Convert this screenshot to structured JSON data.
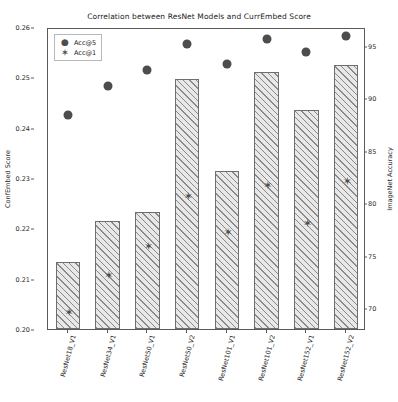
{
  "chart_data": {
    "type": "bar",
    "title": "Correlation between ResNet Models and CurrEmbed Score",
    "categories": [
      "ResNet18_V1",
      "ResNet34_V1",
      "ResNet50_V1",
      "ResNet50_V2",
      "ResNet101_V1",
      "ResNet101_V2",
      "ResNet152_V1",
      "ResNet152_V2"
    ],
    "xlabel": "",
    "ylabel": "ConfEmbed Score",
    "ylim": [
      0.2,
      0.26
    ],
    "yticks": [
      "0.20",
      "0.21",
      "0.22",
      "0.23",
      "0.24",
      "0.25",
      "0.26"
    ],
    "ytickvalues": [
      0.2,
      0.21,
      0.22,
      0.23,
      0.24,
      0.25,
      0.26
    ],
    "y2label": "ImageNet Accuracy",
    "y2lim": [
      68.0,
      96.8
    ],
    "y2ticks": [
      "70",
      "75",
      "80",
      "85",
      "90",
      "95"
    ],
    "y2tickvalues": [
      70,
      75,
      80,
      85,
      90,
      95
    ],
    "grid": false,
    "legend_position": "upper left",
    "series": [
      {
        "name": "bars",
        "label": "ConfEmbed Score",
        "axis": "left",
        "values": [
          0.2134,
          0.2215,
          0.2233,
          0.2497,
          0.2314,
          0.2511,
          0.2435,
          0.2525
        ]
      },
      {
        "name": "Acc@5",
        "label": "Acc@5",
        "axis": "right",
        "marker": "circle",
        "values": [
          88.6,
          91.4,
          92.9,
          95.4,
          93.5,
          95.8,
          94.6,
          96.1
        ]
      },
      {
        "name": "Acc@1",
        "label": "Acc@1",
        "axis": "right",
        "marker": "star",
        "values": [
          69.8,
          73.3,
          76.1,
          80.9,
          77.4,
          81.9,
          78.3,
          82.3
        ]
      }
    ]
  },
  "legend": {
    "items": [
      {
        "label": "Acc@5",
        "symbol": "●"
      },
      {
        "label": "Acc@1",
        "symbol": "✶"
      }
    ]
  },
  "colors": {
    "marker": "#4d4d4d",
    "bar_face": "#e8e8e8",
    "bar_edge": "#6e6e6e",
    "hatch": "#8a8a8a",
    "axis": "#5a5a5a",
    "text": "#1a1a1a"
  }
}
